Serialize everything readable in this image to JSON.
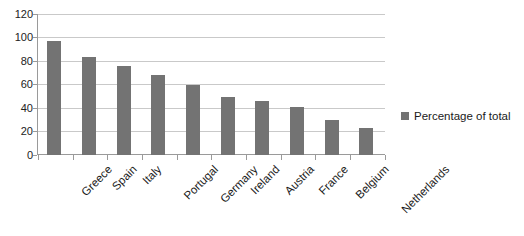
{
  "chart_data": {
    "type": "bar",
    "title": "",
    "subtitle": "",
    "xlabel": "",
    "ylabel": "",
    "categories": [
      "Greece",
      "Spain",
      "Italy",
      "Portugal",
      "Germany",
      "Ireland",
      "Austria",
      "France",
      "Belgium",
      "Netherlands"
    ],
    "values": [
      97,
      83,
      76,
      68,
      60,
      49,
      46,
      41,
      30,
      23
    ],
    "series": [
      {
        "name": "Percentage of total",
        "values": [
          97,
          83,
          76,
          68,
          60,
          49,
          46,
          41,
          30,
          23
        ],
        "color": "#737373"
      }
    ],
    "ylim": [
      0,
      120
    ],
    "y_ticks": [
      0,
      20,
      40,
      60,
      80,
      100,
      120
    ],
    "y_tick_labels": [
      "0",
      "20",
      "40",
      "60",
      "80",
      "100",
      "120"
    ],
    "grid": true,
    "grid_axis": "y",
    "legend": {
      "position": "right",
      "entries": [
        {
          "label": "Percentage of total",
          "color": "#737373"
        }
      ]
    },
    "x_tick_label_rotation": -45,
    "colors": {
      "bar": "#737373",
      "gridline": "#c9c9c9",
      "axis": "#9a9a9a",
      "text": "#1a1a1a",
      "background": "#ffffff"
    }
  }
}
